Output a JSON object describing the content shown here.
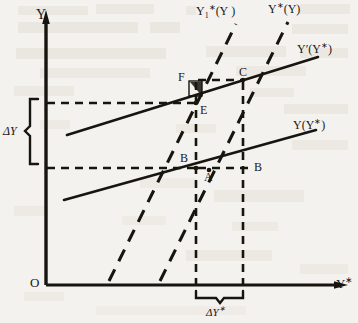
{
  "figure": {
    "axes": {
      "y_axis_label": "Y",
      "x_axis_label": "Y*",
      "origin_label": "O"
    },
    "curves": [
      {
        "id": "y1-star-of-y",
        "label_plain": "Y1*(Y )",
        "style": "dashed",
        "slope": "steep"
      },
      {
        "id": "y-star-of-y",
        "label_plain": "Y*(Y)",
        "style": "dashed",
        "slope": "steep"
      },
      {
        "id": "y-prime-of-y-star",
        "label_plain": "Y'(Y*)",
        "style": "solid",
        "slope": "shallow"
      },
      {
        "id": "y-of-y-star",
        "label_plain": "Y(Y*)",
        "style": "solid",
        "slope": "shallow"
      }
    ],
    "points": [
      {
        "id": "D",
        "label": "D"
      },
      {
        "id": "C",
        "label": "C"
      },
      {
        "id": "E",
        "label": "E"
      },
      {
        "id": "F",
        "label": "F"
      },
      {
        "id": "A",
        "label": "A"
      },
      {
        "id": "B",
        "label": "B"
      }
    ],
    "brackets": [
      {
        "id": "delta-y",
        "label_plain": "ΔY",
        "orientation": "vertical"
      },
      {
        "id": "delta-y-star",
        "label_plain": "ΔY*",
        "orientation": "horizontal"
      }
    ],
    "colors": {
      "ink": "#1a1815",
      "paper": "#f4f2ee",
      "bleed": "#cfc9bf"
    }
  },
  "bleedthrough": {
    "line1": "",
    "line2": "",
    "line3": "",
    "caption": ""
  }
}
